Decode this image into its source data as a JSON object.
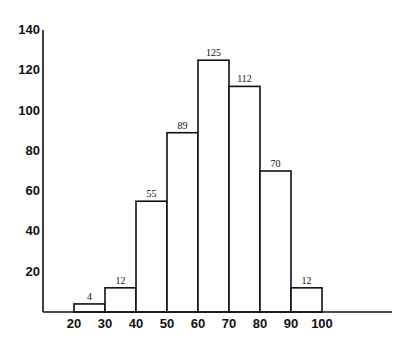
{
  "chart_data": {
    "type": "bar",
    "subtype": "histogram",
    "title": "",
    "xlabel": "",
    "ylabel": "",
    "bin_edges": [
      20,
      30,
      40,
      50,
      60,
      70,
      80,
      90,
      100
    ],
    "categories": [
      "20-30",
      "30-40",
      "40-50",
      "50-60",
      "60-70",
      "70-80",
      "80-90",
      "90-100"
    ],
    "values": [
      4,
      12,
      55,
      89,
      125,
      112,
      70,
      12
    ],
    "bar_labels": [
      "4",
      "12",
      "55",
      "89",
      "125",
      "112",
      "70",
      "12"
    ],
    "x_ticks": [
      "20",
      "30",
      "40",
      "50",
      "60",
      "70",
      "80",
      "90",
      "100"
    ],
    "y_ticks": [
      "20",
      "40",
      "60",
      "80",
      "100",
      "120",
      "140"
    ],
    "ylim": [
      0,
      140
    ],
    "xlim": [
      10,
      120
    ],
    "grid": false,
    "legend": null
  },
  "colors": {
    "ink": "#111111",
    "background": "#ffffff",
    "bar_fill": "#ffffff"
  }
}
